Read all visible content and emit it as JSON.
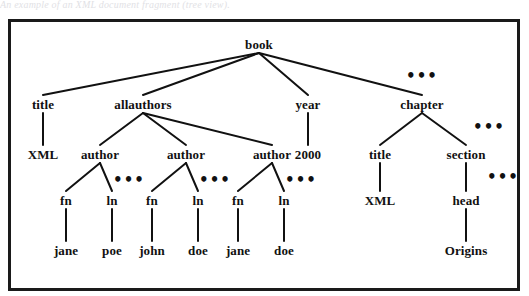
{
  "caption": {
    "text": "An example of an XML document fragment (tree view)."
  },
  "figure": {
    "frame_color": "#1a1a1a",
    "background": "#ffffff",
    "edge_color": "#111111",
    "text_color": "#111111"
  },
  "tree": {
    "nodes": [
      {
        "id": "book",
        "label": "book",
        "x": 248,
        "y": 22,
        "kind": "element"
      },
      {
        "id": "title1",
        "label": "title",
        "x": 32,
        "y": 82,
        "kind": "element"
      },
      {
        "id": "allauthors",
        "label": "allauthors",
        "x": 132,
        "y": 82,
        "kind": "element"
      },
      {
        "id": "year",
        "label": "year",
        "x": 297,
        "y": 82,
        "kind": "element"
      },
      {
        "id": "chapter",
        "label": "chapter",
        "x": 411,
        "y": 82,
        "kind": "element"
      },
      {
        "id": "xml1",
        "label": "XML",
        "x": 32,
        "y": 132,
        "kind": "value"
      },
      {
        "id": "author1",
        "label": "author",
        "x": 89,
        "y": 132,
        "kind": "element"
      },
      {
        "id": "author2",
        "label": "author",
        "x": 175,
        "y": 132,
        "kind": "element"
      },
      {
        "id": "author3",
        "label": "author",
        "x": 261,
        "y": 132,
        "kind": "element"
      },
      {
        "id": "y2000",
        "label": "2000",
        "x": 297,
        "y": 132,
        "kind": "value"
      },
      {
        "id": "title2",
        "label": "title",
        "x": 369,
        "y": 132,
        "kind": "element"
      },
      {
        "id": "section",
        "label": "section",
        "x": 455,
        "y": 132,
        "kind": "element"
      },
      {
        "id": "fn1",
        "label": "fn",
        "x": 55,
        "y": 178,
        "kind": "element"
      },
      {
        "id": "ln1",
        "label": "ln",
        "x": 101,
        "y": 178,
        "kind": "element"
      },
      {
        "id": "fn2",
        "label": "fn",
        "x": 141,
        "y": 178,
        "kind": "element"
      },
      {
        "id": "ln2",
        "label": "ln",
        "x": 187,
        "y": 178,
        "kind": "element"
      },
      {
        "id": "fn3",
        "label": "fn",
        "x": 227,
        "y": 178,
        "kind": "element"
      },
      {
        "id": "ln3",
        "label": "ln",
        "x": 273,
        "y": 178,
        "kind": "element"
      },
      {
        "id": "xml2",
        "label": "XML",
        "x": 369,
        "y": 178,
        "kind": "value"
      },
      {
        "id": "head",
        "label": "head",
        "x": 455,
        "y": 178,
        "kind": "element"
      },
      {
        "id": "jane1",
        "label": "jane",
        "x": 55,
        "y": 228,
        "kind": "value"
      },
      {
        "id": "poe",
        "label": "poe",
        "x": 101,
        "y": 228,
        "kind": "value"
      },
      {
        "id": "john",
        "label": "john",
        "x": 141,
        "y": 228,
        "kind": "value"
      },
      {
        "id": "doe1",
        "label": "doe",
        "x": 187,
        "y": 228,
        "kind": "value"
      },
      {
        "id": "jane2",
        "label": "jane",
        "x": 227,
        "y": 228,
        "kind": "value"
      },
      {
        "id": "doe2",
        "label": "doe",
        "x": 273,
        "y": 228,
        "kind": "value"
      },
      {
        "id": "origins",
        "label": "Origins",
        "x": 455,
        "y": 228,
        "kind": "value"
      }
    ],
    "edges": [
      {
        "from": "book",
        "to": "title1"
      },
      {
        "from": "book",
        "to": "allauthors"
      },
      {
        "from": "book",
        "to": "year"
      },
      {
        "from": "book",
        "to": "chapter"
      },
      {
        "from": "title1",
        "to": "xml1"
      },
      {
        "from": "allauthors",
        "to": "author1"
      },
      {
        "from": "allauthors",
        "to": "author2"
      },
      {
        "from": "allauthors",
        "to": "author3"
      },
      {
        "from": "year",
        "to": "y2000"
      },
      {
        "from": "chapter",
        "to": "title2"
      },
      {
        "from": "chapter",
        "to": "section"
      },
      {
        "from": "author1",
        "to": "fn1"
      },
      {
        "from": "author1",
        "to": "ln1"
      },
      {
        "from": "author2",
        "to": "fn2"
      },
      {
        "from": "author2",
        "to": "ln2"
      },
      {
        "from": "author3",
        "to": "fn3"
      },
      {
        "from": "author3",
        "to": "ln3"
      },
      {
        "from": "title2",
        "to": "xml2"
      },
      {
        "from": "section",
        "to": "head"
      },
      {
        "from": "fn1",
        "to": "jane1"
      },
      {
        "from": "ln1",
        "to": "poe"
      },
      {
        "from": "fn2",
        "to": "john"
      },
      {
        "from": "ln2",
        "to": "doe1"
      },
      {
        "from": "fn3",
        "to": "jane2"
      },
      {
        "from": "ln3",
        "to": "doe2"
      },
      {
        "from": "head",
        "to": "origins"
      }
    ],
    "ellipses": [
      {
        "id": "ell-chapter-siblings",
        "label": "•••",
        "x": 411,
        "y": 54,
        "note": "more chapter siblings under book"
      },
      {
        "id": "ell-section-siblings",
        "label": "•••",
        "x": 478,
        "y": 105,
        "note": "more section siblings under chapter"
      },
      {
        "id": "ell-head-siblings",
        "label": "•••",
        "x": 492,
        "y": 155,
        "note": "more children under section"
      },
      {
        "id": "ell-author1",
        "label": "•••",
        "x": 118,
        "y": 158,
        "note": "more children under first author"
      },
      {
        "id": "ell-author2",
        "label": "•••",
        "x": 204,
        "y": 158,
        "note": "more children under second author"
      },
      {
        "id": "ell-author3",
        "label": "•••",
        "x": 290,
        "y": 158,
        "note": "more children under third author"
      }
    ]
  }
}
